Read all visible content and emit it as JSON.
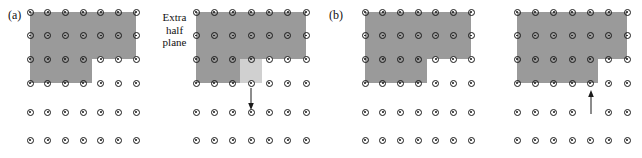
{
  "figure": {
    "background_color": "#ffffff",
    "width": 642,
    "height": 158,
    "colors": {
      "shaded_region": "#9a9a9a",
      "light_shaded_region": "#d0d0d0",
      "atom_outline": "#1a1a1a",
      "atom_fill": "#ffffff",
      "arrow": "#1a1a1a",
      "text": "#111111"
    }
  },
  "annotations": {
    "extra_half_plane": {
      "line1": "Extra",
      "line2": "half",
      "line3": "plane"
    }
  },
  "panels": [
    {
      "id": "a",
      "label": "(a)",
      "lattices": [
        {
          "id": "a-left",
          "name": "notched-lattice",
          "columns": 7,
          "rows": 6,
          "shaded_rows": 4,
          "notch": {
            "column_start": 4,
            "row_start": 3,
            "description": "step notch at lower right of shaded block"
          },
          "light_column": null,
          "arrow": null
        },
        {
          "id": "a-right",
          "name": "dislocation-lattice",
          "columns": 7,
          "rows": 6,
          "shaded_rows": 4,
          "notch": {
            "column_start": 4,
            "row_start": 3,
            "description": "step notch at lower right of shaded block"
          },
          "light_column": {
            "column_index": 3,
            "row_start": 3,
            "description": "pale extra half plane column"
          },
          "arrow": {
            "direction": "down",
            "column_index": 4,
            "from_row": 3,
            "to_row": 4
          }
        }
      ]
    },
    {
      "id": "b",
      "label": "(b)",
      "lattices": [
        {
          "id": "b-left",
          "name": "notched-lattice",
          "columns": 7,
          "rows": 6,
          "shaded_rows": 4,
          "notch": {
            "column_start": 4,
            "row_start": 3,
            "description": "step notch at lower right of shaded block"
          },
          "light_column": null,
          "arrow": null
        },
        {
          "id": "b-right",
          "name": "dislocation-lattice",
          "columns": 7,
          "rows": 6,
          "shaded_rows": 4,
          "notch": {
            "column_start": 5,
            "row_start": 3,
            "description": "step notch shifted one column right"
          },
          "light_column": null,
          "arrow": {
            "direction": "up",
            "column_index": 5,
            "from_row": 4,
            "to_row": 3
          }
        }
      ]
    }
  ]
}
